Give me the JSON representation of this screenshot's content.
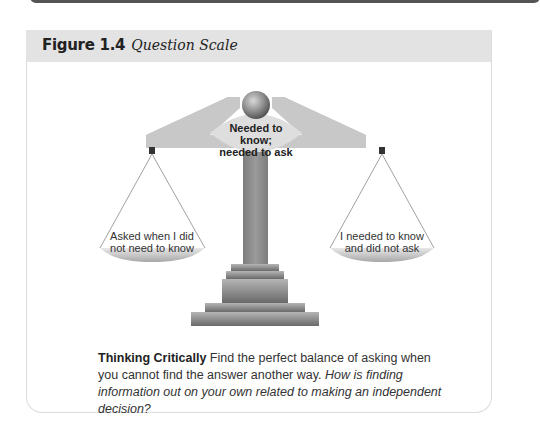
{
  "figure": {
    "number": "Figure 1.4",
    "title": "Question Scale"
  },
  "scale": {
    "center_label": [
      "Needed to know;",
      "needed to ask"
    ],
    "left_pan_label": [
      "Asked when I did",
      "not need to know"
    ],
    "right_pan_label": [
      "I needed to know",
      "and did not ask"
    ]
  },
  "caption": {
    "lead": "Thinking Critically",
    "body": " Find the perfect balance of asking when you cannot find the answer another way. ",
    "question": "How is finding information out on your own related to making an independent decision?"
  },
  "colors": {
    "header_bg": "#e3e3e3",
    "beam": "#c8c8c8",
    "post": "#8a8a8a",
    "text": "#333333"
  }
}
